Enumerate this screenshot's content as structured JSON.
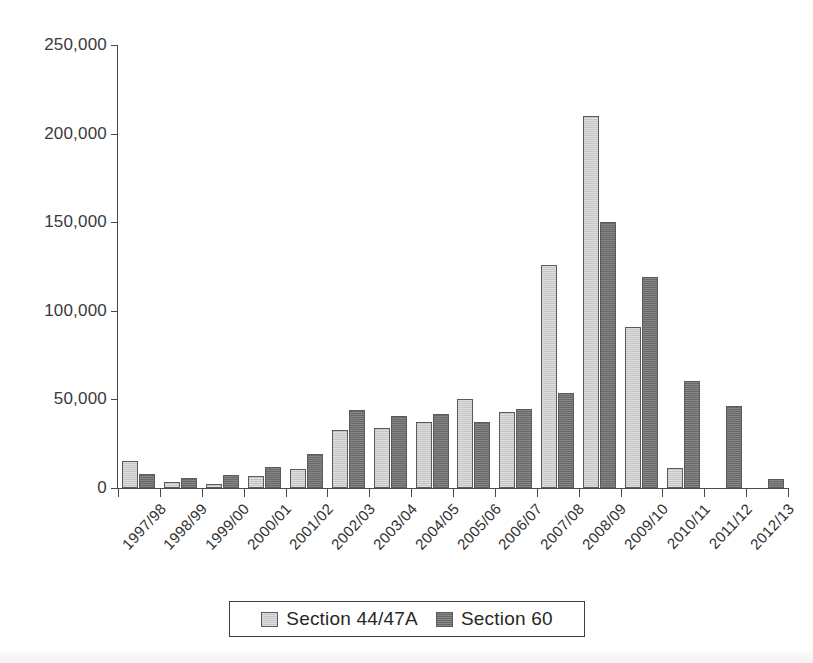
{
  "chart_data": {
    "type": "bar",
    "title": "",
    "xlabel": "",
    "ylabel": "",
    "ylim": [
      0,
      250000
    ],
    "grid": false,
    "legend_position": "bottom",
    "ytick_labels": [
      "250,000",
      "200,000",
      "150,000",
      "100,000",
      "50,000",
      "0"
    ],
    "ytick_values": [
      250000,
      200000,
      150000,
      100000,
      50000,
      0
    ],
    "categories": [
      "1997/98",
      "1998/99",
      "1999/00",
      "2000/01",
      "2001/02",
      "2002/03",
      "2003/04",
      "2004/05",
      "2005/06",
      "2006/07",
      "2007/08",
      "2008/09",
      "2009/10",
      "2010/11",
      "2011/12",
      "2012/13"
    ],
    "series": [
      {
        "name": "Section 44/47A",
        "color": "#cdcdcd",
        "values": [
          15000,
          3500,
          2500,
          6500,
          10500,
          32500,
          34000,
          37500,
          50000,
          43000,
          126000,
          210000,
          91000,
          11500,
          0,
          0
        ]
      },
      {
        "name": "Section 60",
        "color": "#757575",
        "values": [
          8000,
          5500,
          7500,
          12000,
          19000,
          44000,
          40500,
          41500,
          37000,
          44500,
          53500,
          150000,
          119000,
          60500,
          46500,
          5000
        ]
      }
    ]
  },
  "legend": {
    "entries": [
      {
        "label": "Section 44/47A",
        "swatch": "light-gray"
      },
      {
        "label": "Section 60",
        "swatch": "dark-gray"
      }
    ]
  },
  "colors": {
    "series_1": "#cdcdcd",
    "series_2": "#757575",
    "axis": "#4a4a4a",
    "text": "#2b2b2b",
    "background": "#ffffff"
  }
}
